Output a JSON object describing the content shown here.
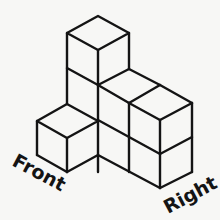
{
  "figure": {
    "type": "isometric-cube-structure",
    "labels": {
      "front": "Front",
      "right": "Right"
    },
    "colors": {
      "stroke": "#141414",
      "background": "#f7f7f5"
    },
    "cube_count_visible": 6
  }
}
